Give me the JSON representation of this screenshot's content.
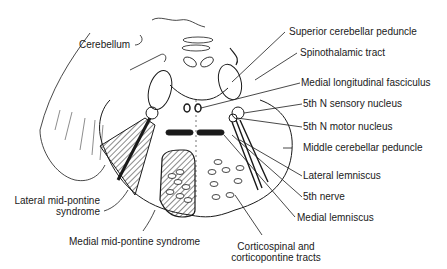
{
  "diagram": {
    "labels": {
      "cerebellum": "Cerebellum",
      "superior_cerebellar_peduncle": "Superior cerebellar peduncle",
      "spinothalamic_tract": "Spinothalamic tract",
      "medial_longitudinal_fasciculus": "Medial longitudinal fasciculus",
      "fifth_n_sensory_nucleus": "5th N sensory nucleus",
      "fifth_n_motor_nucleus": "5th N motor nucleus",
      "middle_cerebellar_peduncle": "Middle cerebellar peduncle",
      "lateral_lemniscus": "Lateral lemniscus",
      "fifth_nerve": "5th nerve",
      "medial_lemniscus": "Medial lemniscus",
      "corticospinal_line1": "Corticospinal and",
      "corticospinal_line2": "corticopontine tracts",
      "lateral_mid_pontine_line1": "Lateral mid-pontine",
      "lateral_mid_pontine_line2": "syndrome",
      "medial_mid_pontine": "Medial mid-pontine syndrome"
    },
    "colors": {
      "ink": "#1a1a1a",
      "background": "#ffffff"
    }
  }
}
